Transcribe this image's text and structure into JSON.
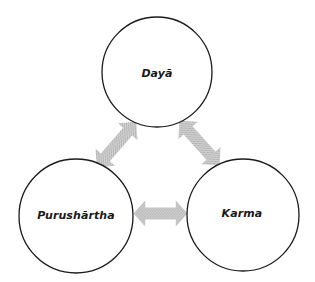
{
  "diagram": {
    "type": "cycle",
    "nodes": [
      {
        "id": "daya",
        "label": "Dayā",
        "cx": 157,
        "cy": 72,
        "r": 55
      },
      {
        "id": "purushartha",
        "label": "Purushārtha",
        "cx": 76,
        "cy": 216,
        "r": 57
      },
      {
        "id": "karma",
        "label": "Karma",
        "cx": 243,
        "cy": 215,
        "r": 56
      }
    ],
    "edges": [
      {
        "from": "daya",
        "to": "purushartha",
        "style": "double-headed-arrow"
      },
      {
        "from": "daya",
        "to": "karma",
        "style": "double-headed-arrow"
      },
      {
        "from": "purushartha",
        "to": "karma",
        "style": "double-headed-arrow"
      }
    ],
    "colors": {
      "circle_stroke": "#1a1a1a",
      "circle_fill": "#ffffff",
      "arrow_fill": "#c4c4c4",
      "arrow_dot": "#a8a8a8",
      "label_text": "#1a1a1a"
    }
  }
}
